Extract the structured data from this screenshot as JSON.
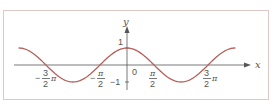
{
  "chart_data": {
    "type": "line",
    "title": "",
    "function": "y = cos x",
    "xlabel": "x",
    "ylabel": "y",
    "origin_label": "0",
    "x_ticks": [
      {
        "value": -4.712,
        "num": "3",
        "den": "2",
        "sign": "−",
        "suffix": "π"
      },
      {
        "value": -1.571,
        "num": "π",
        "den": "2",
        "sign": "−",
        "suffix": ""
      },
      {
        "value": 1.571,
        "num": "π",
        "den": "2",
        "sign": "",
        "suffix": ""
      },
      {
        "value": 4.712,
        "num": "3",
        "den": "2",
        "sign": "",
        "suffix": "π"
      }
    ],
    "y_ticks": [
      {
        "value": 1,
        "label": "1"
      },
      {
        "value": -1,
        "label": "−1"
      }
    ],
    "xlim": [
      -6.3,
      6.3
    ],
    "ylim": [
      -1,
      1
    ],
    "grid": false,
    "legend": null,
    "series": [
      {
        "name": "cos x",
        "color": "#b5605a",
        "x": [
          -6.28,
          -4.71,
          -3.14,
          -1.57,
          0,
          1.57,
          3.14,
          4.71,
          6.28
        ],
        "values": [
          1,
          0,
          -1,
          0,
          1,
          0,
          -1,
          0,
          1
        ]
      }
    ]
  },
  "colors": {
    "curve": "#b5605a",
    "axis": "#555555",
    "frame": "#dcc9c6"
  }
}
